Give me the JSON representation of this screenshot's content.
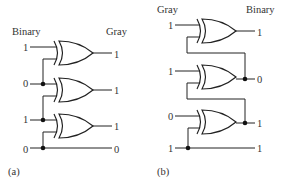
{
  "diagram": {
    "colors": {
      "line": "#222222",
      "text": "#333333",
      "background": "#ffffff"
    },
    "part_a": {
      "caption": "(a)",
      "input_header": "Binary",
      "output_header": "Gray",
      "inputs": [
        "1",
        "0",
        "1",
        "0"
      ],
      "outputs": [
        "1",
        "1",
        "1",
        "0"
      ],
      "gate_type": "XOR",
      "gate_count": 3
    },
    "part_b": {
      "caption": "(b)",
      "input_header": "Gray",
      "output_header": "Binary",
      "inputs": [
        "1",
        "1",
        "0",
        "1"
      ],
      "outputs": [
        "1",
        "0",
        "1",
        "1"
      ],
      "gate_type": "XOR",
      "gate_count": 3
    }
  }
}
